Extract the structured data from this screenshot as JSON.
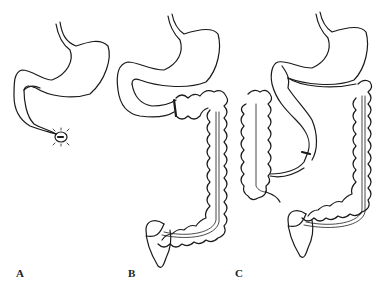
{
  "figure": {
    "panels": [
      {
        "label": "A",
        "content": "stomach with duodenum ending in closed stump"
      },
      {
        "label": "B",
        "content": "stomach with transverse colon interposition and full colon"
      },
      {
        "label": "C",
        "content": "stomach with colon loop interposition and full colon"
      }
    ],
    "colors": {
      "line": "#1a1a1a",
      "background": "#ffffff"
    }
  }
}
